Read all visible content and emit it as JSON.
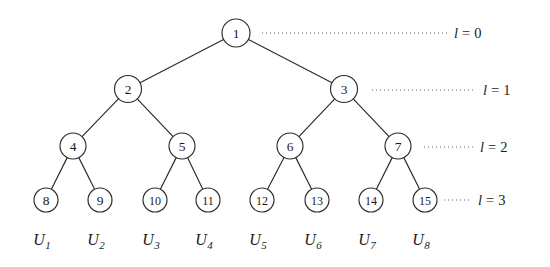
{
  "figure": {
    "type": "binary-tree-diagram",
    "background_color": "#ffffff",
    "stroke_color": "#2a2a2a",
    "leader_color": "#6e6e6e",
    "text_color": "#1a1a1a"
  },
  "tree": {
    "node_labels_by_level": [
      [
        "1"
      ],
      [
        "2",
        "3"
      ],
      [
        "4",
        "5",
        "6",
        "7"
      ],
      [
        "8",
        "9",
        "10",
        "11",
        "12",
        "13",
        "14",
        "15"
      ]
    ],
    "nodes": [
      {
        "id": "n1",
        "label": "1",
        "level": 0,
        "cx": 236,
        "cy": 33,
        "r": 14
      },
      {
        "id": "n2",
        "label": "2",
        "level": 1,
        "cx": 128,
        "cy": 89,
        "r": 13.5
      },
      {
        "id": "n3",
        "label": "3",
        "level": 1,
        "cx": 344,
        "cy": 89,
        "r": 13.5
      },
      {
        "id": "n4",
        "label": "4",
        "level": 2,
        "cx": 73,
        "cy": 146,
        "r": 13
      },
      {
        "id": "n5",
        "label": "5",
        "level": 2,
        "cx": 182,
        "cy": 146,
        "r": 13
      },
      {
        "id": "n6",
        "label": "6",
        "level": 2,
        "cx": 290,
        "cy": 146,
        "r": 13
      },
      {
        "id": "n7",
        "label": "7",
        "level": 2,
        "cx": 398,
        "cy": 146,
        "r": 13
      },
      {
        "id": "n8",
        "label": "8",
        "level": 3,
        "cx": 46,
        "cy": 200,
        "r": 12
      },
      {
        "id": "n9",
        "label": "9",
        "level": 3,
        "cx": 100,
        "cy": 200,
        "r": 12
      },
      {
        "id": "n10",
        "label": "10",
        "level": 3,
        "cx": 155,
        "cy": 200,
        "r": 12
      },
      {
        "id": "n11",
        "label": "11",
        "level": 3,
        "cx": 208,
        "cy": 200,
        "r": 12
      },
      {
        "id": "n12",
        "label": "12",
        "level": 3,
        "cx": 262,
        "cy": 200,
        "r": 12
      },
      {
        "id": "n13",
        "label": "13",
        "level": 3,
        "cx": 317,
        "cy": 200,
        "r": 12
      },
      {
        "id": "n14",
        "label": "14",
        "level": 3,
        "cx": 371,
        "cy": 200,
        "r": 12
      },
      {
        "id": "n15",
        "label": "15",
        "level": 3,
        "cx": 425,
        "cy": 200,
        "r": 12
      }
    ],
    "edges": [
      {
        "from": "n1",
        "to": "n2"
      },
      {
        "from": "n1",
        "to": "n3"
      },
      {
        "from": "n2",
        "to": "n4"
      },
      {
        "from": "n2",
        "to": "n5"
      },
      {
        "from": "n3",
        "to": "n6"
      },
      {
        "from": "n3",
        "to": "n7"
      },
      {
        "from": "n4",
        "to": "n8"
      },
      {
        "from": "n4",
        "to": "n9"
      },
      {
        "from": "n5",
        "to": "n10"
      },
      {
        "from": "n5",
        "to": "n11"
      },
      {
        "from": "n6",
        "to": "n12"
      },
      {
        "from": "n6",
        "to": "n13"
      },
      {
        "from": "n7",
        "to": "n14"
      },
      {
        "from": "n7",
        "to": "n15"
      }
    ]
  },
  "levels": [
    {
      "id": "lvl0",
      "var": "l",
      "eq": "=",
      "value": "0",
      "text": "l = 0",
      "y": 33,
      "dot_x1": 262,
      "dot_x2": 447,
      "label_x": 454
    },
    {
      "id": "lvl1",
      "var": "l",
      "eq": "=",
      "value": "1",
      "text": "l = 1",
      "y": 90,
      "dot_x1": 372,
      "dot_x2": 476,
      "label_x": 483
    },
    {
      "id": "lvl2",
      "var": "l",
      "eq": "=",
      "value": "2",
      "text": "l = 2",
      "y": 147,
      "dot_x1": 424,
      "dot_x2": 473,
      "label_x": 480
    },
    {
      "id": "lvl3",
      "var": "l",
      "eq": "=",
      "value": "3",
      "text": "l = 3",
      "y": 200,
      "dot_x1": 444,
      "dot_x2": 471,
      "label_x": 478
    }
  ],
  "leaf_groups": [
    {
      "id": "u1",
      "base": "U",
      "sub": "1",
      "text": "U1",
      "x": 46,
      "y": 245,
      "node": "8"
    },
    {
      "id": "u2",
      "base": "U",
      "sub": "2",
      "text": "U2",
      "x": 100,
      "y": 245,
      "node": "9"
    },
    {
      "id": "u3",
      "base": "U",
      "sub": "3",
      "text": "U3",
      "x": 155,
      "y": 245,
      "node": "10"
    },
    {
      "id": "u4",
      "base": "U",
      "sub": "4",
      "text": "U4",
      "x": 208,
      "y": 245,
      "node": "11"
    },
    {
      "id": "u5",
      "base": "U",
      "sub": "5",
      "text": "U5",
      "x": 262,
      "y": 245,
      "node": "12"
    },
    {
      "id": "u6",
      "base": "U",
      "sub": "6",
      "text": "U6",
      "x": 317,
      "y": 245,
      "node": "13"
    },
    {
      "id": "u7",
      "base": "U",
      "sub": "7",
      "text": "U7",
      "x": 371,
      "y": 245,
      "node": "14"
    },
    {
      "id": "u8",
      "base": "U",
      "sub": "8",
      "text": "U8",
      "x": 425,
      "y": 245,
      "node": "15"
    }
  ]
}
